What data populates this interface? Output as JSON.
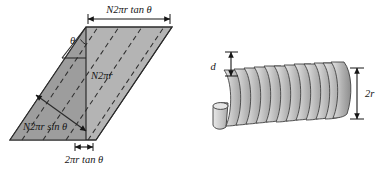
{
  "figure": {
    "background_color": "#ffffff",
    "ink_color": "#161616"
  },
  "left_diagram": {
    "name": "unrolled-solenoid-parallelogram",
    "fill_left": "#9d9d9d",
    "fill_right": "#b4b4b4",
    "stroke": "#2b2b2b",
    "labels": {
      "top_width": "N2πr tan θ",
      "vertical_height": "N2πr",
      "diagonal": "N2πr sin θ",
      "bottom_offset": "2πr tan θ",
      "angle": "θ"
    }
  },
  "right_diagram": {
    "name": "helix-coil",
    "coil_count": 12,
    "fill_light": "#d8d8d8",
    "fill_mid": "#b0b0b0",
    "fill_dark": "#8c8c8c",
    "stroke": "#3a3a3a",
    "labels": {
      "pitch": "d",
      "diameter": "2r"
    }
  }
}
